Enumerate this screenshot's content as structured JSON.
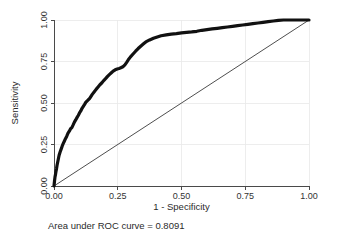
{
  "chart_data": {
    "type": "line",
    "title": "",
    "xlabel": "1 - Specificity",
    "ylabel": "Sensitivity",
    "xlim": [
      0,
      1
    ],
    "ylim": [
      0,
      1
    ],
    "grid": true,
    "legend": "none",
    "xticks": [
      "0.00",
      "0.25",
      "0.50",
      "0.75",
      "1.00"
    ],
    "xtick_values": [
      0,
      0.25,
      0.5,
      0.75,
      1
    ],
    "yticks": [
      "0.00",
      "0.25",
      "0.50",
      "0.75",
      "1.00"
    ],
    "ytick_values": [
      0,
      0.25,
      0.5,
      0.75,
      1
    ],
    "annotation": "Area under ROC curve = 0.8091",
    "auc": 0.8091,
    "series": [
      {
        "name": "ROC curve",
        "style": "thick-black-step",
        "x": [
          0.0,
          0.002,
          0.004,
          0.006,
          0.008,
          0.01,
          0.012,
          0.014,
          0.016,
          0.018,
          0.02,
          0.024,
          0.028,
          0.032,
          0.036,
          0.04,
          0.045,
          0.05,
          0.055,
          0.06,
          0.065,
          0.07,
          0.075,
          0.08,
          0.085,
          0.09,
          0.095,
          0.1,
          0.105,
          0.11,
          0.115,
          0.12,
          0.125,
          0.13,
          0.135,
          0.14,
          0.145,
          0.15,
          0.158,
          0.165,
          0.172,
          0.18,
          0.188,
          0.195,
          0.203,
          0.21,
          0.218,
          0.225,
          0.232,
          0.24,
          0.248,
          0.255,
          0.262,
          0.27,
          0.278,
          0.285,
          0.292,
          0.3,
          0.31,
          0.32,
          0.33,
          0.34,
          0.35,
          0.36,
          0.375,
          0.39,
          0.405,
          0.42,
          0.44,
          0.46,
          0.48,
          0.5,
          0.52,
          0.54,
          0.56,
          0.58,
          0.6,
          0.62,
          0.64,
          0.66,
          0.68,
          0.7,
          0.72,
          0.74,
          0.76,
          0.78,
          0.8,
          0.82,
          0.84,
          0.86,
          0.88,
          0.9,
          0.93,
          0.96,
          1.0
        ],
        "y": [
          0.0,
          0.03,
          0.055,
          0.07,
          0.09,
          0.105,
          0.125,
          0.14,
          0.155,
          0.17,
          0.185,
          0.205,
          0.222,
          0.24,
          0.255,
          0.268,
          0.285,
          0.3,
          0.318,
          0.33,
          0.345,
          0.352,
          0.368,
          0.385,
          0.398,
          0.412,
          0.425,
          0.44,
          0.452,
          0.468,
          0.48,
          0.492,
          0.505,
          0.512,
          0.52,
          0.528,
          0.54,
          0.552,
          0.568,
          0.582,
          0.595,
          0.61,
          0.622,
          0.635,
          0.648,
          0.66,
          0.672,
          0.682,
          0.692,
          0.7,
          0.705,
          0.708,
          0.712,
          0.718,
          0.73,
          0.745,
          0.762,
          0.778,
          0.795,
          0.812,
          0.828,
          0.842,
          0.855,
          0.868,
          0.88,
          0.89,
          0.898,
          0.905,
          0.91,
          0.915,
          0.918,
          0.922,
          0.925,
          0.928,
          0.932,
          0.938,
          0.942,
          0.946,
          0.95,
          0.954,
          0.958,
          0.962,
          0.966,
          0.97,
          0.974,
          0.978,
          0.982,
          0.986,
          0.99,
          0.994,
          0.998,
          1.0,
          1.0,
          1.0,
          1.0
        ]
      },
      {
        "name": "Reference diagonal",
        "style": "thin-diagonal",
        "x": [
          0,
          1
        ],
        "y": [
          0,
          1
        ]
      }
    ]
  },
  "figure": {
    "xaxis_title": "1 - Specificity",
    "yaxis_title": "Sensitivity",
    "caption": "Area under ROC curve = 0.8091",
    "colors": {
      "curve": "#111111",
      "reference": "#3a3a3a",
      "grid": "#e8e8e8",
      "axis": "#4a4a4a",
      "background": "#ffffff",
      "text": "#2b2b2b"
    }
  }
}
